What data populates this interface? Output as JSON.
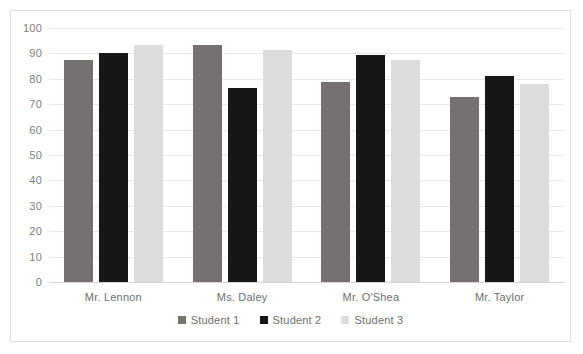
{
  "chart_data": {
    "type": "bar",
    "title": "",
    "subtitle": "",
    "xlabel": "",
    "ylabel": "",
    "categories": [
      "Mr. Lennon",
      "Ms. Daley",
      "Mr. O'Shea",
      "Mr. Taylor"
    ],
    "series": [
      {
        "name": "Student 1",
        "color": "#767171",
        "values": [
          87.5,
          93.2,
          78.6,
          72.7
        ]
      },
      {
        "name": "Student 2",
        "color": "#171717",
        "values": [
          90.0,
          76.2,
          89.4,
          81.3
        ]
      },
      {
        "name": "Student 3",
        "color": "#dcdcdc",
        "values": [
          93.2,
          91.3,
          87.5,
          77.8
        ]
      }
    ],
    "ylim": [
      0,
      100
    ],
    "yticks": [
      0,
      10,
      20,
      30,
      40,
      50,
      60,
      70,
      80,
      90,
      100
    ],
    "ytick_labels": [
      "0",
      "10",
      "20",
      "30",
      "40",
      "50",
      "60",
      "70",
      "80",
      "90",
      "100"
    ],
    "grid": true,
    "grid_axis": "y",
    "legend": true,
    "legend_position": "bottom",
    "legend_entries": [
      "Student 1",
      "Student 2",
      "Student 3"
    ],
    "bar_group_gap": true,
    "background_color": "#ffffff",
    "border_color": "#e2e2e2",
    "gridline_color": "#e8e8e8",
    "tick_label_color": "#808080",
    "category_label_color": "#6e6e6e"
  }
}
